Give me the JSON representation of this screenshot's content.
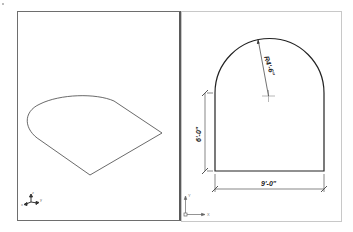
{
  "viewports": {
    "left": {
      "label": "isometric-view",
      "ucs_icon": "ucs-3d-icon"
    },
    "right": {
      "label": "plan-view",
      "ucs_icon": "ucs-2d-icon",
      "ucs_x_label": "X",
      "ucs_y_label": "Y"
    }
  },
  "dimensions": {
    "radius": "R4'-6\"",
    "height": "6'-0\"",
    "width": "9'-0\""
  },
  "colors": {
    "line": "#333333",
    "frame": "#6e6e6e",
    "dim_line": "#555555"
  }
}
